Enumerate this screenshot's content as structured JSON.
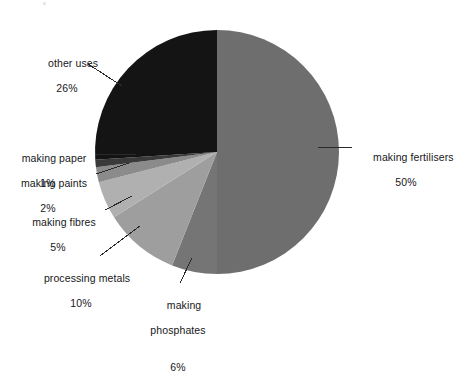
{
  "chart_data": {
    "type": "pie",
    "title": "",
    "subtitle": "",
    "xlabel": "",
    "ylabel": "",
    "legend_position": "none",
    "grid": false,
    "unit": "%",
    "start_angle_deg": 0,
    "direction": "clockwise",
    "categories": [
      "making fertilisers",
      "making phosphates",
      "processing metals",
      "making fibres",
      "making paints",
      "making paper",
      "other uses"
    ],
    "values": [
      50,
      6,
      10,
      5,
      2,
      1,
      26
    ],
    "slices": [
      {
        "label": "making fertilisers",
        "value": 50,
        "display": "50%",
        "color": "#6e6e6e"
      },
      {
        "label": "making phosphates",
        "value": 6,
        "display": "6%",
        "color": "#757575"
      },
      {
        "label": "processing metals",
        "value": 10,
        "display": "10%",
        "color": "#9e9e9e"
      },
      {
        "label": "making fibres",
        "value": 5,
        "display": "5%",
        "color": "#b0b0b0"
      },
      {
        "label": "making paints",
        "value": 2,
        "display": "2%",
        "color": "#8b8b8b"
      },
      {
        "label": "making paper",
        "value": 1,
        "display": "1%",
        "color": "#3a3a3a"
      },
      {
        "label": "other uses",
        "value": 26,
        "display": "26%",
        "color": "#141414"
      }
    ]
  },
  "labels": {
    "making_fertilisers": {
      "name": "making fertilisers",
      "pct": "50%"
    },
    "making_phosphates": {
      "name": "making",
      "name2": "phosphates",
      "pct": "6%"
    },
    "processing_metals": {
      "name": "processing metals",
      "pct": "10%"
    },
    "making_fibres": {
      "name": "making fibres",
      "pct": "5%"
    },
    "making_paints": {
      "name": "making paints",
      "pct": "2%"
    },
    "making_paper": {
      "name": "making paper",
      "pct": "1%"
    },
    "other_uses": {
      "name": "other uses",
      "pct": "26%"
    }
  }
}
